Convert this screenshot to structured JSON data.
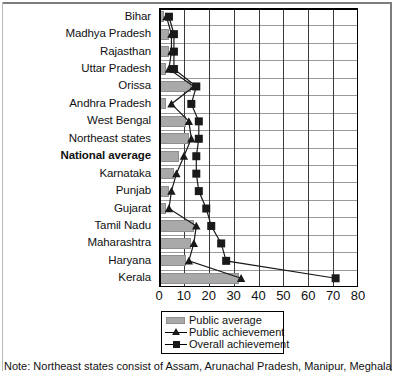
{
  "chart_data": {
    "type": "bar",
    "title": "",
    "xlabel": "",
    "ylabel": "",
    "orientation": "horizontal",
    "xlim": [
      0,
      80
    ],
    "xticks": [
      0,
      10,
      20,
      30,
      40,
      50,
      60,
      70,
      80
    ],
    "xtick_labels": [
      "0",
      "10",
      "20",
      "30",
      "40",
      "50",
      "60",
      "70",
      "80"
    ],
    "grid": true,
    "legend_position": "bottom-center",
    "categories": [
      "Bihar",
      "Madhya Pradesh",
      "Rajasthan",
      "Uttar Pradesh",
      "Orissa",
      "Andhra Pradesh",
      "West Bengal",
      "Northeast states",
      "National average",
      "Karnataka",
      "Punjab",
      "Gujarat",
      "Tamil Nadu",
      "Maharashtra",
      "Haryana",
      "Kerala"
    ],
    "emphasized_category": "National average",
    "series": [
      {
        "name": "Public average",
        "type": "bar",
        "color": "#a9a9a9",
        "values": [
          2,
          4,
          4,
          3,
          13,
          3,
          11,
          12,
          8,
          6,
          4,
          3,
          14,
          13,
          11,
          32
        ]
      },
      {
        "name": "Public achievement",
        "type": "line",
        "marker": "triangle",
        "color": "#1a1a1a",
        "values": [
          3,
          5,
          5,
          4,
          14,
          5,
          12,
          13,
          10,
          7,
          5,
          4,
          15,
          14,
          12,
          33
        ]
      },
      {
        "name": "Overall achievement",
        "type": "line",
        "marker": "square",
        "color": "#1a1a1a",
        "values": [
          4,
          6,
          6,
          6,
          15,
          13,
          16,
          16,
          15,
          15,
          16,
          19,
          21,
          25,
          27,
          71
        ]
      }
    ]
  },
  "legend": {
    "entries": [
      {
        "label": "Public average",
        "key": "bar-swatch"
      },
      {
        "label": "Public achievement",
        "key": "line-triangle"
      },
      {
        "label": "Overall achievement",
        "key": "line-square"
      }
    ]
  },
  "footnote": {
    "text": "Note: Northeast states consist of Assam, Arunachal Pradesh, Manipur, Meghalaya,"
  }
}
